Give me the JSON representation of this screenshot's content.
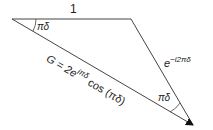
{
  "diagram": {
    "type": "phasor-triangle",
    "colors": {
      "line": "#333333",
      "text": "#222222",
      "background": "#ffffff"
    },
    "labels": {
      "top_side": "1",
      "right_side_base": "e",
      "right_side_exp": "−i2πδ",
      "angle_left": "πδ",
      "angle_bottom": "πδ",
      "hypotenuse_prefix": "G = 2e",
      "hypotenuse_exp": "iπδ",
      "hypotenuse_suffix": " cos (πδ)"
    }
  }
}
